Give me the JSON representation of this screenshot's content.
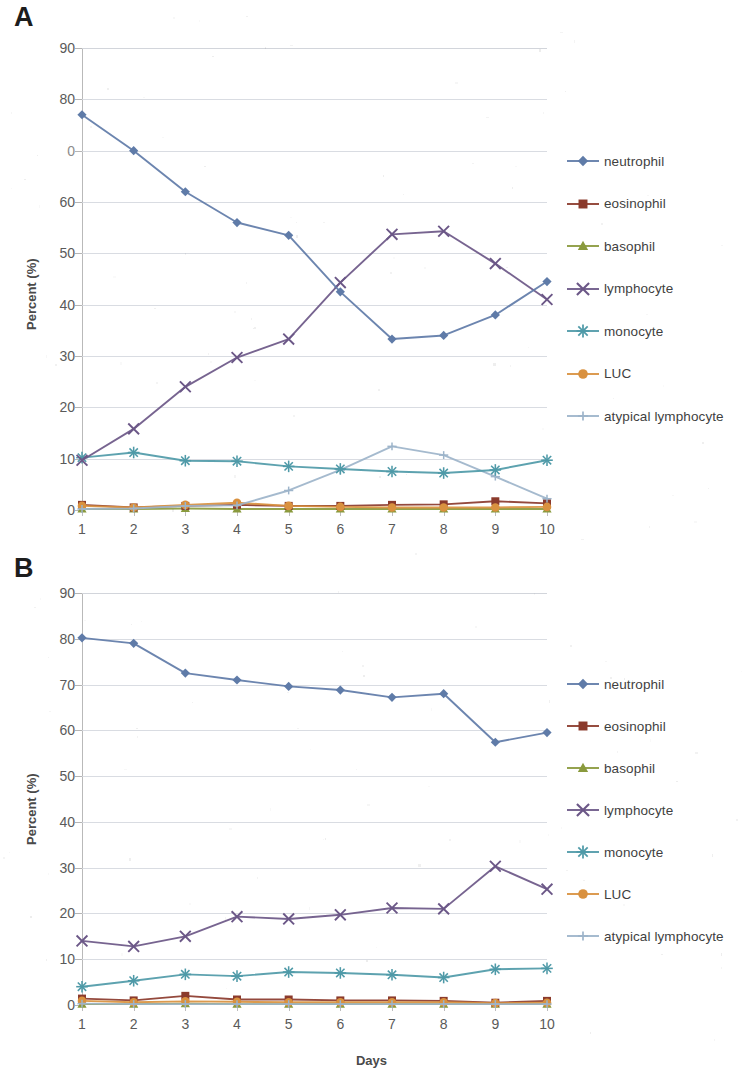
{
  "figure": {
    "xaxis_title": "Days",
    "yaxis_title": "Percent (%)"
  },
  "panels": [
    {
      "letter": "A",
      "yaxis_title": "Percent (%)",
      "ytick_labels": [
        "90",
        "80",
        "0",
        "60",
        "50",
        "40",
        "30",
        "20",
        "10",
        "0"
      ],
      "xtick_labels": [
        "1",
        "2",
        "3",
        "4",
        "5",
        "6",
        "7",
        "8",
        "9",
        "10"
      ],
      "legend": [
        "neutrophil",
        "eosinophil",
        "basophil",
        "lymphocyte",
        "monocyte",
        "LUC",
        "atypical lymphocyte"
      ]
    },
    {
      "letter": "B",
      "yaxis_title": "Percent (%)",
      "ytick_labels": [
        "90",
        "80",
        "70",
        "60",
        "50",
        "40",
        "30",
        "20",
        "10",
        "0"
      ],
      "xtick_labels": [
        "1",
        "2",
        "3",
        "4",
        "5",
        "6",
        "7",
        "8",
        "9",
        "10"
      ],
      "legend": [
        "neutrophil",
        "eosinophil",
        "basophil",
        "lymphocyte",
        "monocyte",
        "LUC",
        "atypical lymphocyte"
      ]
    }
  ],
  "chart_data": [
    {
      "type": "line",
      "panel": "A",
      "title": "",
      "xlabel": "Days",
      "ylabel": "Percent (%)",
      "x": [
        1,
        2,
        3,
        4,
        5,
        6,
        7,
        8,
        9,
        10
      ],
      "categories": [
        "1",
        "2",
        "3",
        "4",
        "5",
        "6",
        "7",
        "8",
        "9",
        "10"
      ],
      "xlim": [
        1,
        10
      ],
      "ylim": [
        0,
        90
      ],
      "ytick_values": [
        0,
        10,
        20,
        30,
        40,
        50,
        60,
        70,
        80,
        90
      ],
      "grid": true,
      "legend_position": "right",
      "series": [
        {
          "name": "neutrophil",
          "color": "#5f7ba8",
          "marker": "diamond",
          "values": [
            77.0,
            70.0,
            62.0,
            56.0,
            53.5,
            42.5,
            33.3,
            34.0,
            38.0,
            44.5
          ]
        },
        {
          "name": "eosinophil",
          "color": "#8b3a2c",
          "marker": "square",
          "values": [
            1.0,
            0.5,
            0.8,
            1.0,
            0.8,
            0.8,
            1.0,
            1.1,
            1.7,
            1.3
          ]
        },
        {
          "name": "basophil",
          "color": "#8a9a3d",
          "marker": "triangle",
          "values": [
            0.2,
            0.2,
            0.3,
            0.2,
            0.2,
            0.2,
            0.2,
            0.2,
            0.2,
            0.2
          ]
        },
        {
          "name": "lymphocyte",
          "color": "#6b5787",
          "marker": "x",
          "values": [
            9.7,
            15.8,
            24.0,
            29.7,
            33.3,
            44.3,
            53.7,
            54.3,
            48.0,
            41.0
          ]
        },
        {
          "name": "monocyte",
          "color": "#4f9aa8",
          "marker": "asterisk",
          "values": [
            10.2,
            11.2,
            9.6,
            9.5,
            8.5,
            8.0,
            7.5,
            7.2,
            7.8,
            9.7
          ]
        },
        {
          "name": "LUC",
          "color": "#d9913f",
          "marker": "circle",
          "values": [
            0.8,
            0.5,
            1.0,
            1.4,
            0.8,
            0.6,
            0.5,
            0.5,
            0.5,
            0.6
          ]
        },
        {
          "name": "atypical lymphocyte",
          "color": "#9db4ca",
          "marker": "line",
          "values": [
            0.2,
            0.3,
            0.8,
            0.9,
            3.8,
            7.8,
            12.4,
            10.7,
            6.5,
            2.2
          ]
        }
      ]
    },
    {
      "type": "line",
      "panel": "B",
      "title": "",
      "xlabel": "Days",
      "ylabel": "Percent (%)",
      "x": [
        1,
        2,
        3,
        4,
        5,
        6,
        7,
        8,
        9,
        10
      ],
      "categories": [
        "1",
        "2",
        "3",
        "4",
        "5",
        "6",
        "7",
        "8",
        "9",
        "10"
      ],
      "xlim": [
        1,
        10
      ],
      "ylim": [
        0,
        90
      ],
      "ytick_values": [
        0,
        10,
        20,
        30,
        40,
        50,
        60,
        70,
        80,
        90
      ],
      "grid": true,
      "legend_position": "right",
      "series": [
        {
          "name": "neutrophil",
          "color": "#5f7ba8",
          "marker": "diamond",
          "values": [
            80.2,
            79.0,
            72.5,
            71.0,
            69.6,
            68.8,
            67.2,
            68.0,
            57.4,
            59.5
          ]
        },
        {
          "name": "eosinophil",
          "color": "#8b3a2c",
          "marker": "square",
          "values": [
            1.4,
            1.0,
            2.0,
            1.2,
            1.2,
            1.0,
            1.0,
            0.9,
            0.5,
            0.9
          ]
        },
        {
          "name": "basophil",
          "color": "#8a9a3d",
          "marker": "triangle",
          "values": [
            0.2,
            0.2,
            0.3,
            0.2,
            0.2,
            0.2,
            0.2,
            0.2,
            0.2,
            0.2
          ]
        },
        {
          "name": "lymphocyte",
          "color": "#6b5787",
          "marker": "x",
          "values": [
            14.0,
            12.8,
            15.0,
            19.3,
            18.8,
            19.7,
            21.2,
            21.0,
            30.3,
            25.3
          ]
        },
        {
          "name": "monocyte",
          "color": "#4f9aa8",
          "marker": "asterisk",
          "values": [
            4.0,
            5.3,
            6.7,
            6.3,
            7.2,
            7.0,
            6.6,
            6.0,
            7.8,
            8.0
          ]
        },
        {
          "name": "LUC",
          "color": "#d9913f",
          "marker": "circle",
          "values": [
            0.9,
            0.6,
            0.8,
            0.7,
            0.6,
            0.6,
            0.6,
            0.6,
            0.4,
            0.5
          ]
        },
        {
          "name": "atypical lymphocyte",
          "color": "#9db4ca",
          "marker": "line",
          "values": [
            0.3,
            0.2,
            0.2,
            0.2,
            0.2,
            0.2,
            0.2,
            0.2,
            0.2,
            0.2
          ]
        }
      ]
    }
  ]
}
